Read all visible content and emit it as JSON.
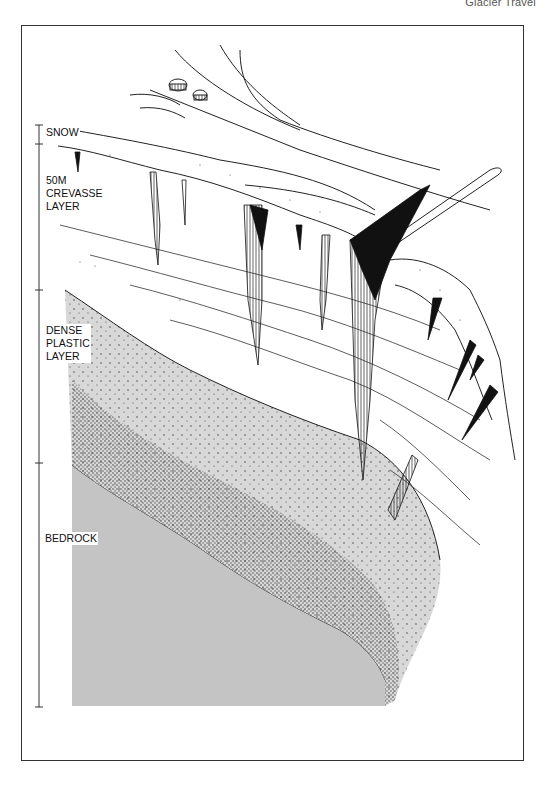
{
  "header": {
    "title": "Glacier Travel"
  },
  "diagram": {
    "layers": [
      {
        "id": "snow",
        "label": "SNOW",
        "scale_top": 125,
        "scale_bottom": 144
      },
      {
        "id": "crevasse",
        "label": "50M\nCREVASSE\nLAYER",
        "line1": "50M",
        "line2": "CREVASSE",
        "line3": "LAYER",
        "scale_top": 144,
        "scale_bottom": 290
      },
      {
        "id": "plastic",
        "label": "DENSE\nPLASTIC\nLAYER",
        "line1": "DENSE",
        "line2": "PLASTIC",
        "line3": "LAYER",
        "scale_top": 290,
        "scale_bottom": 463
      },
      {
        "id": "bedrock",
        "label": "BEDROCK",
        "scale_top": 463,
        "scale_bottom": 707
      }
    ],
    "colors": {
      "ink": "#1a1a1a",
      "bedrock_gray": "#c4c4c4",
      "plastic_gray": "#d6d6d6",
      "paper": "#ffffff"
    }
  }
}
